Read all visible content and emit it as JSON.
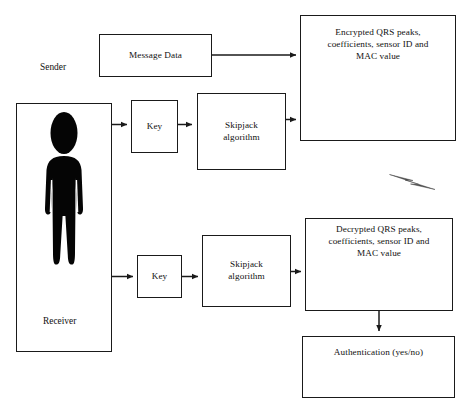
{
  "diagram": {
    "stroke_color": "#1a1a1a",
    "background_color": "#ffffff",
    "bolt_color": "#4a4a4a",
    "nodes": {
      "sender_label": "Sender",
      "receiver_label": "Receiver",
      "message_data": "Message Data",
      "key_top": "Key",
      "key_bottom": "Key",
      "skipjack_top": "Skipjack algorithm",
      "skipjack_bottom": "Skipjack algorithm",
      "encrypted_payload": "Encrypted QRS peaks, coefficients, sensor ID and MAC value",
      "decrypted_payload": "Decrypted QRS peaks, coefficients, sensor ID and MAC value",
      "authentication": "Authentication (yes/no)"
    },
    "node_lines": {
      "skipjack_top": [
        "Skipjack",
        "algorithm"
      ],
      "skipjack_bottom": [
        "Skipjack",
        "algorithm"
      ],
      "encrypted_payload": [
        "Encrypted QRS peaks,",
        "coefficients, sensor ID and",
        "MAC value"
      ],
      "decrypted_payload": [
        "Decrypted QRS peaks,",
        "coefficients, sensor ID and",
        "MAC value"
      ]
    },
    "icons": {
      "person_sender": "person-icon",
      "person_receiver": "person-icon",
      "wireless_link": "lightning-bolt-icon"
    },
    "caption": ""
  }
}
